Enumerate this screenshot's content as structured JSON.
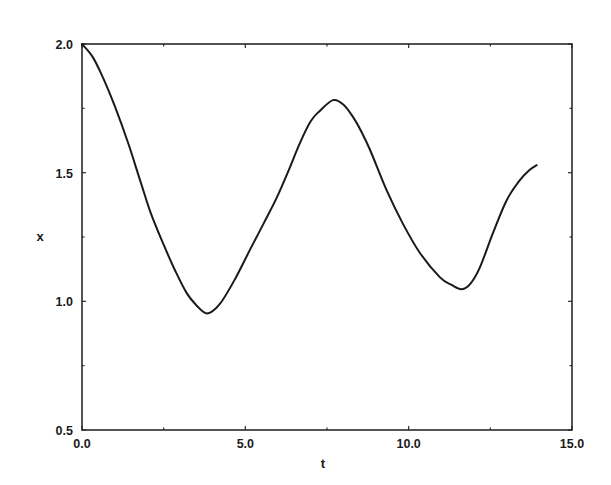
{
  "chart_data": {
    "type": "line",
    "title": "",
    "xlabel": "t",
    "ylabel": "x",
    "xlim": [
      0.0,
      15.0
    ],
    "ylim": [
      0.5,
      2.0
    ],
    "grid": false,
    "legend": null,
    "xticks": [
      0.0,
      5.0,
      10.0,
      15.0
    ],
    "xtick_labels": [
      "0.0",
      "5.0",
      "10.0",
      "15.0"
    ],
    "yticks": [
      0.5,
      1.0,
      1.5,
      2.0
    ],
    "ytick_labels": [
      "0.5",
      "1.0",
      "1.5",
      "2.0"
    ],
    "x_minor_ticks": [
      2.5,
      7.5,
      12.5
    ],
    "y_minor_ticks": [
      0.75,
      1.25,
      1.75
    ],
    "series": [
      {
        "name": "x(t)",
        "color": "#1a1a1a",
        "x": [
          0.0,
          0.3,
          0.58,
          1.0,
          1.4,
          1.78,
          2.1,
          2.48,
          2.85,
          3.21,
          3.5,
          3.83,
          4.22,
          4.7,
          5.14,
          5.55,
          5.97,
          6.33,
          6.67,
          7.0,
          7.28,
          7.68,
          8.0,
          8.3,
          8.55,
          8.82,
          9.33,
          9.83,
          10.35,
          10.96,
          11.3,
          11.63,
          11.9,
          12.18,
          12.58,
          13.0,
          13.4,
          13.7,
          13.92
        ],
        "y": [
          2.0,
          1.955,
          1.887,
          1.76,
          1.62,
          1.47,
          1.345,
          1.226,
          1.12,
          1.031,
          0.985,
          0.953,
          0.99,
          1.09,
          1.2,
          1.3,
          1.405,
          1.51,
          1.615,
          1.7,
          1.74,
          1.782,
          1.765,
          1.716,
          1.66,
          1.588,
          1.43,
          1.3,
          1.187,
          1.093,
          1.065,
          1.047,
          1.07,
          1.132,
          1.265,
          1.393,
          1.47,
          1.51,
          1.529
        ]
      }
    ]
  },
  "axes": {
    "xlabel": "t",
    "ylabel": "x"
  }
}
